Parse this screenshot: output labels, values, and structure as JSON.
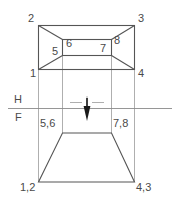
{
  "drawing": {
    "title": "Orthographic projection: truncated pyramid",
    "type": "multiview-engineering-drawing",
    "colors": {
      "object_line": "#555555",
      "projection_line": "#9a9a9a",
      "fold_line": "#8a8a8a",
      "center_line": "#9a9a9a",
      "arrow_fill": "#1a1a1a",
      "text": "#4a4a4a",
      "background": "#ffffff"
    },
    "fold_line": {
      "upper_label": "H",
      "lower_label": "F"
    },
    "top_view": {
      "name": "horizontal-view",
      "outer_corners": [
        {
          "label": "2",
          "x": 33,
          "y": 19,
          "position": "top-left"
        },
        {
          "label": "3",
          "x": 136,
          "y": 19,
          "position": "top-right"
        },
        {
          "label": "1",
          "x": 32,
          "y": 72,
          "position": "bottom-left"
        },
        {
          "label": "4",
          "x": 136,
          "y": 72,
          "position": "bottom-right"
        }
      ],
      "inner_corners": [
        {
          "label": "5",
          "x": 53,
          "y": 52,
          "position": "bottom-left"
        },
        {
          "label": "6",
          "x": 66,
          "y": 42,
          "position": "top-left"
        },
        {
          "label": "7",
          "x": 104,
          "y": 47,
          "position": "top-right"
        },
        {
          "label": "8",
          "x": 115,
          "y": 39,
          "position": "top-right-outer"
        }
      ]
    },
    "front_view": {
      "name": "frontal-view",
      "corners": [
        {
          "label": "5,6",
          "x": 42,
          "y": 121,
          "position": "top-left"
        },
        {
          "label": "7,8",
          "x": 114,
          "y": 121,
          "position": "top-right"
        },
        {
          "label": "1,2",
          "x": 22,
          "y": 184,
          "position": "bottom-left"
        },
        {
          "label": "4,3",
          "x": 136,
          "y": 184,
          "position": "bottom-right"
        }
      ]
    },
    "arrow": {
      "name": "viewing-direction-arrow",
      "direction": "down"
    }
  }
}
